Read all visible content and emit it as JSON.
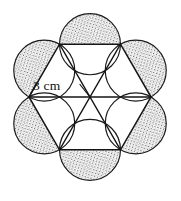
{
  "figure": {
    "type": "geometry-diagram",
    "background_color": "#ffffff",
    "stroke_color": "#1a1a1a",
    "shade_color": "#9a9a9a",
    "canvas": {
      "width": 181,
      "height": 201
    }
  },
  "geometry": {
    "center": {
      "x": 90,
      "y": 97
    },
    "hexagon": {
      "circumradius_px": 61,
      "vertex_count": 6,
      "vertex_angles_deg": [
        0,
        60,
        120,
        180,
        240,
        300
      ],
      "vertices": [
        {
          "x": 151,
          "y": 97
        },
        {
          "x": 120.5,
          "y": 44.2
        },
        {
          "x": 59.5,
          "y": 44.2
        },
        {
          "x": 29,
          "y": 97
        },
        {
          "x": 59.5,
          "y": 149.8
        },
        {
          "x": 120.5,
          "y": 149.8
        }
      ]
    },
    "circles": {
      "count": 6,
      "radius_px": 30.5,
      "centers": [
        {
          "x": 135.75,
          "y": 70.6
        },
        {
          "x": 90,
          "y": 44.2
        },
        {
          "x": 44.25,
          "y": 70.6
        },
        {
          "x": 44.25,
          "y": 123.4
        },
        {
          "x": 90,
          "y": 149.8
        },
        {
          "x": 135.75,
          "y": 123.4
        }
      ]
    },
    "diagonals": {
      "count": 3,
      "description": "three long diagonals through the center forming six triangles"
    }
  },
  "annotations": {
    "radius_label": {
      "text": "3 cm",
      "value": 3,
      "unit": "cm",
      "measures": "center-to-vertex radius",
      "text_x": 33,
      "text_y": 90,
      "leader_from": {
        "x": 84,
        "y": 85
      },
      "leader_to": {
        "x": 90,
        "y": 97
      },
      "tick_from": {
        "x": 36,
        "y": 84
      },
      "tick_to": {
        "x": 29,
        "y": 97
      }
    }
  }
}
